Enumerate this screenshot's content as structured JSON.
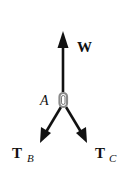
{
  "diagram": {
    "type": "free-body-diagram",
    "point": {
      "label": "A"
    },
    "forces": [
      {
        "label": "W",
        "subscript": "",
        "direction": "up"
      },
      {
        "label": "T",
        "subscript": "B",
        "direction": "down-left"
      },
      {
        "label": "T",
        "subscript": "C",
        "direction": "down-right"
      }
    ],
    "colors": {
      "stroke": "#111111",
      "ring": "#999999",
      "background": "#ffffff"
    }
  }
}
